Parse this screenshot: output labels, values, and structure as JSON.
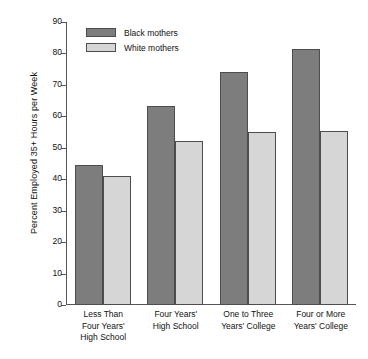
{
  "chart_data": {
    "type": "bar",
    "title": "",
    "xlabel": "",
    "ylabel": "Percent Employed 35+ Hours per Week",
    "ylim": [
      0,
      90
    ],
    "yticks": [
      0,
      10,
      20,
      30,
      40,
      50,
      60,
      70,
      80,
      90
    ],
    "grid": false,
    "legend_position": "top-left-inside",
    "categories": [
      "Less Than Four Years' High School",
      "Four Years' High School",
      "One to Three Years' College",
      "Four or More Years' College"
    ],
    "category_lines": [
      [
        "Less Than",
        "Four Years'",
        "High School"
      ],
      [
        "Four Years'",
        "High School"
      ],
      [
        "One to Three",
        "Years' College"
      ],
      [
        "Four or More",
        "Years' College"
      ]
    ],
    "series": [
      {
        "name": "Black mothers",
        "color": "#7d7d7d",
        "values": [
          44.5,
          63.2,
          74.2,
          81.5
        ]
      },
      {
        "name": "White mothers",
        "color": "#d6d6d6",
        "values": [
          41.0,
          52.2,
          55.0,
          55.2
        ]
      }
    ]
  }
}
